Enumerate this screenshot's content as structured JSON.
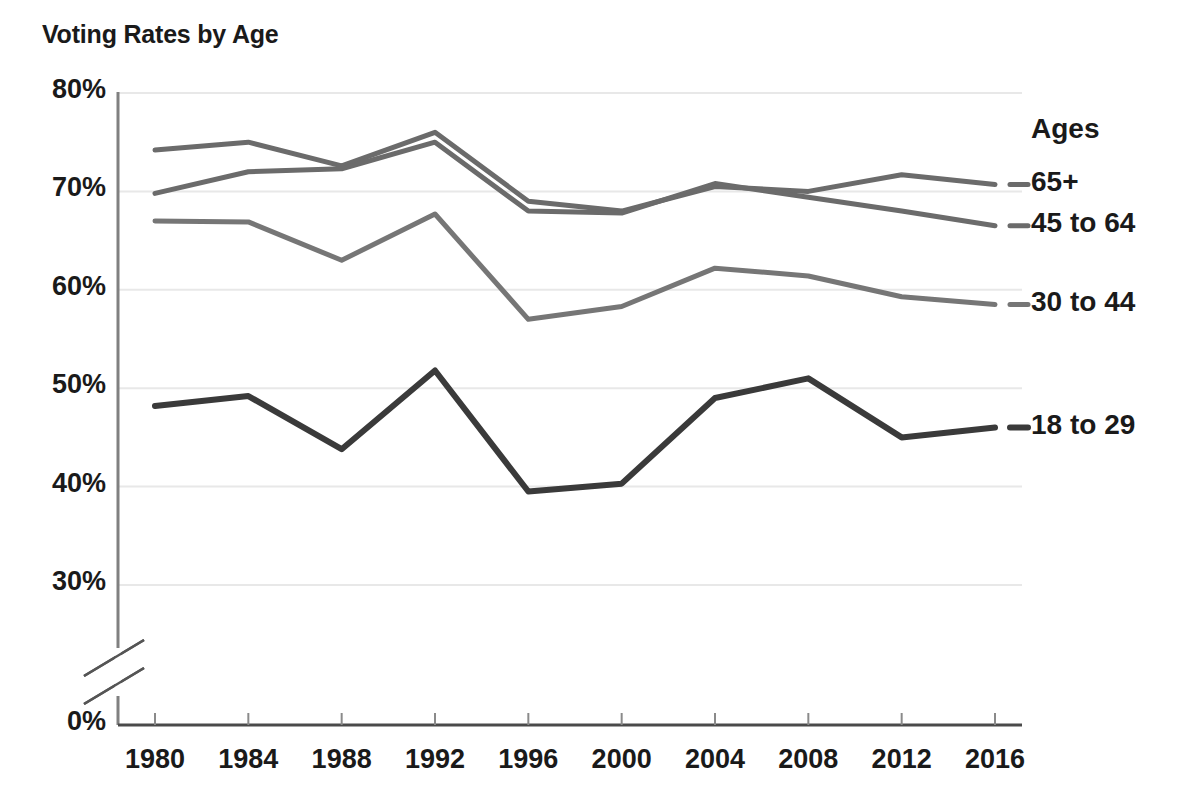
{
  "chart_data": {
    "type": "line",
    "title": "Voting Rates by Age",
    "xlabel": "",
    "ylabel": "",
    "x": [
      1980,
      1984,
      1988,
      1992,
      1996,
      2000,
      2004,
      2008,
      2012,
      2016
    ],
    "xticklabels": [
      "1980",
      "1984",
      "1988",
      "1992",
      "1996",
      "2000",
      "2004",
      "2008",
      "2012",
      "2016"
    ],
    "yticklabels": [
      "80%",
      "70%",
      "60%",
      "50%",
      "40%",
      "30%",
      "0%"
    ],
    "ytickvalues": [
      80,
      70,
      60,
      50,
      40,
      30,
      0
    ],
    "ylim": [
      30,
      80
    ],
    "y_axis_break": true,
    "y_unit": "%",
    "grid": "horizontal",
    "legend_position": "right",
    "legend_title": "Ages",
    "series": [
      {
        "name": "65+",
        "color": "#6b6b6b",
        "width": 5,
        "values": [
          74.2,
          75.0,
          72.6,
          76.0,
          69.0,
          68.0,
          70.5,
          70.0,
          71.7,
          70.7
        ]
      },
      {
        "name": "45 to 64",
        "color": "#6b6b6b",
        "width": 5,
        "values": [
          69.8,
          72.0,
          72.3,
          75.0,
          68.0,
          67.8,
          70.8,
          69.4,
          68.0,
          66.5
        ]
      },
      {
        "name": "30 to 44",
        "color": "#767676",
        "width": 5,
        "values": [
          67.0,
          66.9,
          63.0,
          67.7,
          57.0,
          58.3,
          62.2,
          61.4,
          59.3,
          58.5
        ]
      },
      {
        "name": "18 to 29",
        "color": "#3a3a3a",
        "width": 6,
        "values": [
          48.2,
          49.2,
          43.8,
          51.8,
          39.5,
          40.3,
          49.0,
          51.0,
          45.0,
          46.0
        ]
      }
    ]
  },
  "axes": {
    "axis_color": "#808080",
    "grid_color": "#e8e8e8",
    "break_marker": "axis-break"
  }
}
